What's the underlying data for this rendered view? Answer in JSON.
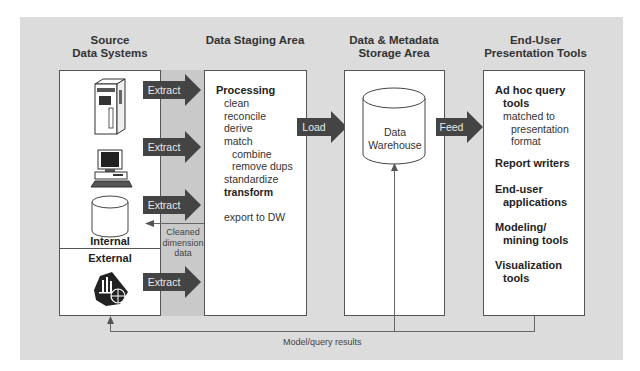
{
  "columns": {
    "source": {
      "title_line1": "Source",
      "title_line2": "Data Systems",
      "internal_label": "Internal",
      "external_label": "External"
    },
    "staging": {
      "title": "Data Staging Area",
      "processing": "Processing",
      "steps": [
        "clean",
        "reconcile",
        "derive",
        "match"
      ],
      "match_substeps": [
        "combine",
        "remove dups"
      ],
      "standardize": "standardize",
      "transform": "transform",
      "export": "export to DW"
    },
    "storage": {
      "title_line1": "Data & Metadata",
      "title_line2": "Storage Area",
      "warehouse_line1": "Data",
      "warehouse_line2": "Warehouse"
    },
    "presentation": {
      "title_line1": "End-User",
      "title_line2": "Presentation Tools",
      "items": [
        {
          "line1": "Ad hoc query",
          "line2": "tools"
        },
        {
          "line1": "Report writers"
        },
        {
          "line1": "End-user",
          "line2": "applications"
        },
        {
          "line1": "Modeling/",
          "line2": "mining tools"
        },
        {
          "line1": "Visualization",
          "line2": "tools"
        }
      ],
      "adhoc_sub": [
        "matched to",
        "presentation",
        "format"
      ]
    }
  },
  "arrows": {
    "extract": "Extract",
    "load": "Load",
    "feed": "Feed"
  },
  "annotations": {
    "cleaned_line1": "Cleaned",
    "cleaned_line2": "dimension",
    "cleaned_line3": "data",
    "feedback": "Model/query results"
  },
  "icons": [
    "mainframe-icon",
    "desktop-computer-icon",
    "database-cylinder-icon",
    "external-data-icon",
    "data-warehouse-cylinder-icon"
  ],
  "colors": {
    "panel": "#dcdcdc",
    "shade": "#c9c9c9",
    "arrow": "#444444",
    "box": "#ffffff"
  }
}
